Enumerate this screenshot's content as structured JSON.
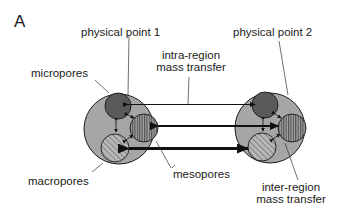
{
  "panel": {
    "letter": "A"
  },
  "labels": {
    "physical_point_1": "physical point 1",
    "physical_point_2": "physical point 2",
    "intra_region_line1": "intra-region",
    "intra_region_line2": "mass transfer",
    "micropores": "micropores",
    "macropores": "macropores",
    "mesopores": "mesopores",
    "inter_region_line1": "inter-region",
    "inter_region_line2": "mass transfer"
  },
  "colors": {
    "outer_circle_fill": "#a6a6a6",
    "micropore_fill": "#5a5a5a",
    "mesopore_fill": "#9a9a9a",
    "macropore_fill": "#b4b4b4",
    "stroke": "#1a1a1a"
  },
  "diagram": {
    "physical_points": [
      {
        "name": "physical point 1",
        "cx": 119,
        "cy": 129,
        "r": 35
      },
      {
        "name": "physical point 2",
        "cx": 270,
        "cy": 128,
        "r": 35
      }
    ],
    "pore_types": [
      "micropores",
      "mesopores",
      "macropores"
    ],
    "intra_region_transfer_widths": {
      "micropores": "thin",
      "mesopores": "medium",
      "macropores": "thick"
    }
  }
}
